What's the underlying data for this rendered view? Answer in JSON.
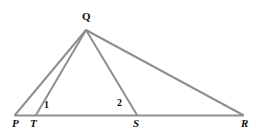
{
  "figure": {
    "type": "geometry-diagram",
    "background_color": "#ffffff",
    "line_color": "#8f8f8f",
    "line_width": 2,
    "label_color": "#111111"
  },
  "points": {
    "P": {
      "label": "P",
      "x": 15,
      "y": 115
    },
    "T": {
      "label": "T",
      "x": 36,
      "y": 115
    },
    "S": {
      "label": "S",
      "x": 137,
      "y": 115
    },
    "R": {
      "label": "R",
      "x": 243,
      "y": 115
    },
    "Q": {
      "label": "Q",
      "x": 86,
      "y": 30
    }
  },
  "segments": [
    {
      "name": "PR",
      "from": "P",
      "to": "R"
    },
    {
      "name": "QP",
      "from": "Q",
      "to": "P"
    },
    {
      "name": "QT",
      "from": "Q",
      "to": "T"
    },
    {
      "name": "QS",
      "from": "Q",
      "to": "S"
    },
    {
      "name": "QR",
      "from": "Q",
      "to": "R"
    }
  ],
  "angle_marks": [
    {
      "name": "angle-1",
      "label": "1",
      "at_vertex": "T",
      "x": 47,
      "y": 105
    },
    {
      "name": "angle-2",
      "label": "2",
      "at_vertex": "S",
      "x": 121,
      "y": 103
    }
  ]
}
